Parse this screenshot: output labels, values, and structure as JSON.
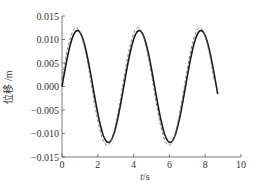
{
  "chart_data": {
    "type": "line",
    "title": "",
    "xlabel": "t/s",
    "xlabel_italic_part": "t",
    "xlabel_unit": "/s",
    "ylabel": "位移 /m",
    "xlim": [
      0,
      10
    ],
    "ylim": [
      -0.015,
      0.015
    ],
    "xticks": [
      0,
      2,
      4,
      6,
      8,
      10
    ],
    "xtick_labels": [
      "0",
      "2",
      "4",
      "6",
      "8",
      "10"
    ],
    "yticks": [
      0.015,
      0.01,
      0.005,
      0.0,
      -0.005,
      -0.01,
      -0.015
    ],
    "ytick_labels": [
      "0.015",
      "0.010",
      "0.005",
      "0.000",
      "−0.005",
      "−0.010",
      "−0.015"
    ],
    "grid": false,
    "legend": null,
    "series": [
      {
        "name": "solid",
        "style": "solid",
        "color": "#1a1a1a",
        "amplitude": 0.0119,
        "period": 3.45,
        "phase": 0.0,
        "t_start": 0.0,
        "t_end": 8.7,
        "key_points": [
          {
            "t": 0.0,
            "y": 0.0
          },
          {
            "t": 0.86,
            "y": 0.0119
          },
          {
            "t": 2.6,
            "y": -0.0119
          },
          {
            "t": 4.3,
            "y": 0.0119
          },
          {
            "t": 6.0,
            "y": -0.0119
          },
          {
            "t": 7.76,
            "y": 0.0119
          },
          {
            "t": 8.7,
            "y": -0.0048
          }
        ]
      },
      {
        "name": "dashed",
        "style": "dashed",
        "color": "#666666",
        "amplitude": 0.0125,
        "period": 3.45,
        "phase": 0.12,
        "t_start": 0.0,
        "t_end": 8.5,
        "key_points": [
          {
            "t": 0.74,
            "y": 0.0125
          },
          {
            "t": 2.47,
            "y": -0.0125
          },
          {
            "t": 4.2,
            "y": 0.0125
          },
          {
            "t": 5.9,
            "y": -0.0125
          },
          {
            "t": 7.65,
            "y": 0.0125
          }
        ]
      }
    ]
  }
}
